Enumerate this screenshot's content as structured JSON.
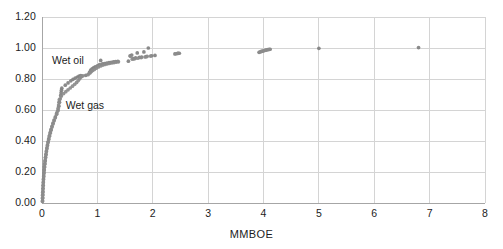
{
  "chart_data": {
    "type": "scatter",
    "title": "",
    "subtitle": "",
    "xlabel": "MMBOE",
    "ylabel": "",
    "xlim": [
      0,
      8
    ],
    "ylim": [
      0,
      1.2
    ],
    "x_ticks": [
      "0",
      "1",
      "2",
      "3",
      "4",
      "5",
      "6",
      "7",
      "8"
    ],
    "y_ticks": [
      "0.00",
      "0.20",
      "0.40",
      "0.60",
      "0.80",
      "1.00",
      "1.20"
    ],
    "grid": true,
    "legend_position": "inline-annotation",
    "marker_color": "#808080",
    "gridline_color": "#d4d4d4",
    "axis_color": "#a6a6a6",
    "annotations": [
      {
        "text": "Wet oil",
        "x": 0.18,
        "y": 0.915
      },
      {
        "text": "Wet gas",
        "x": 0.43,
        "y": 0.625
      }
    ],
    "series": [
      {
        "name": "Wet oil",
        "color": "#808080",
        "points": [
          [
            0.01,
            0.015
          ],
          [
            0.012,
            0.035
          ],
          [
            0.014,
            0.055
          ],
          [
            0.016,
            0.075
          ],
          [
            0.018,
            0.095
          ],
          [
            0.021,
            0.115
          ],
          [
            0.024,
            0.135
          ],
          [
            0.027,
            0.155
          ],
          [
            0.031,
            0.175
          ],
          [
            0.035,
            0.195
          ],
          [
            0.04,
            0.215
          ],
          [
            0.045,
            0.235
          ],
          [
            0.051,
            0.255
          ],
          [
            0.057,
            0.275
          ],
          [
            0.064,
            0.295
          ],
          [
            0.072,
            0.315
          ],
          [
            0.08,
            0.335
          ],
          [
            0.089,
            0.355
          ],
          [
            0.099,
            0.375
          ],
          [
            0.11,
            0.395
          ],
          [
            0.122,
            0.415
          ],
          [
            0.135,
            0.435
          ],
          [
            0.149,
            0.455
          ],
          [
            0.164,
            0.475
          ],
          [
            0.181,
            0.495
          ],
          [
            0.199,
            0.515
          ],
          [
            0.219,
            0.535
          ],
          [
            0.241,
            0.555
          ],
          [
            0.265,
            0.578
          ],
          [
            0.291,
            0.6
          ],
          [
            0.304,
            0.625
          ],
          [
            0.316,
            0.65
          ],
          [
            0.328,
            0.672
          ],
          [
            0.338,
            0.694
          ],
          [
            0.345,
            0.712
          ],
          [
            0.352,
            0.728
          ],
          [
            0.358,
            0.741
          ],
          [
            0.42,
            0.76
          ],
          [
            0.47,
            0.775
          ],
          [
            0.52,
            0.788
          ],
          [
            0.56,
            0.798
          ],
          [
            0.6,
            0.806
          ],
          [
            0.64,
            0.813
          ],
          [
            0.67,
            0.818
          ],
          [
            0.7,
            0.822
          ],
          [
            0.79,
            0.824
          ],
          [
            0.86,
            0.845
          ],
          [
            0.88,
            0.858
          ],
          [
            0.905,
            0.866
          ],
          [
            0.93,
            0.872
          ],
          [
            0.96,
            0.878
          ],
          [
            1.0,
            0.885
          ],
          [
            1.04,
            0.893
          ],
          [
            1.06,
            0.92
          ],
          [
            1.09,
            0.897
          ],
          [
            1.13,
            0.9
          ],
          [
            1.17,
            0.903
          ],
          [
            1.21,
            0.906
          ],
          [
            1.25,
            0.908
          ],
          [
            1.29,
            0.91
          ],
          [
            1.33,
            0.912
          ],
          [
            1.37,
            0.914
          ],
          [
            1.56,
            0.915
          ],
          [
            1.59,
            0.95
          ],
          [
            1.62,
            0.955
          ],
          [
            1.65,
            0.932
          ],
          [
            1.69,
            0.936
          ],
          [
            1.72,
            0.968
          ],
          [
            1.76,
            0.94
          ],
          [
            1.8,
            0.942
          ],
          [
            1.84,
            0.975
          ],
          [
            1.88,
            0.944
          ],
          [
            1.92,
            1.0
          ],
          [
            1.98,
            0.95
          ],
          [
            2.04,
            0.952
          ],
          [
            2.4,
            0.962
          ],
          [
            2.45,
            0.965
          ],
          [
            2.48,
            0.966
          ],
          [
            3.92,
            0.972
          ],
          [
            3.96,
            0.978
          ],
          [
            4.0,
            0.982
          ],
          [
            4.04,
            0.986
          ],
          [
            4.08,
            0.99
          ],
          [
            4.12,
            0.992
          ],
          [
            5.0,
            0.998
          ],
          [
            6.8,
            1.003
          ]
        ]
      },
      {
        "name": "Wet gas",
        "color": "#8c8c8c",
        "points": [
          [
            0.008,
            0.01
          ],
          [
            0.01,
            0.03
          ],
          [
            0.012,
            0.05
          ],
          [
            0.014,
            0.07
          ],
          [
            0.017,
            0.09
          ],
          [
            0.02,
            0.11
          ],
          [
            0.023,
            0.13
          ],
          [
            0.026,
            0.15
          ],
          [
            0.03,
            0.17
          ],
          [
            0.034,
            0.19
          ],
          [
            0.039,
            0.21
          ],
          [
            0.044,
            0.23
          ],
          [
            0.05,
            0.25
          ],
          [
            0.056,
            0.27
          ],
          [
            0.063,
            0.29
          ],
          [
            0.071,
            0.31
          ],
          [
            0.079,
            0.33
          ],
          [
            0.088,
            0.35
          ],
          [
            0.098,
            0.37
          ],
          [
            0.109,
            0.39
          ],
          [
            0.121,
            0.41
          ],
          [
            0.134,
            0.43
          ],
          [
            0.148,
            0.45
          ],
          [
            0.163,
            0.47
          ],
          [
            0.18,
            0.49
          ],
          [
            0.198,
            0.51
          ],
          [
            0.218,
            0.53
          ],
          [
            0.24,
            0.55
          ],
          [
            0.264,
            0.572
          ],
          [
            0.28,
            0.592
          ],
          [
            0.292,
            0.612
          ],
          [
            0.3,
            0.632
          ],
          [
            0.306,
            0.65
          ],
          [
            0.312,
            0.666
          ],
          [
            0.35,
            0.69
          ],
          [
            0.39,
            0.706
          ],
          [
            0.43,
            0.718
          ],
          [
            0.47,
            0.73
          ],
          [
            0.51,
            0.742
          ],
          [
            0.55,
            0.754
          ],
          [
            0.59,
            0.766
          ],
          [
            0.625,
            0.778
          ],
          [
            0.655,
            0.79
          ],
          [
            0.68,
            0.802
          ],
          [
            0.7,
            0.812
          ],
          [
            0.72,
            0.818
          ],
          [
            0.74,
            0.821
          ],
          [
            0.83,
            0.828
          ],
          [
            0.85,
            0.835
          ],
          [
            0.87,
            0.841
          ],
          [
            0.89,
            0.848
          ],
          [
            0.915,
            0.855
          ],
          [
            0.945,
            0.862
          ],
          [
            0.98,
            0.87
          ],
          [
            1.02,
            0.878
          ],
          [
            1.06,
            0.884
          ],
          [
            1.1,
            0.89
          ],
          [
            1.14,
            0.894
          ],
          [
            1.18,
            0.898
          ],
          [
            1.22,
            0.901
          ],
          [
            1.26,
            0.904
          ],
          [
            1.3,
            0.906
          ],
          [
            1.34,
            0.909
          ],
          [
            1.38,
            0.911
          ],
          [
            1.6,
            0.946
          ],
          [
            1.63,
            0.928
          ],
          [
            1.67,
            0.93
          ],
          [
            1.73,
            0.934
          ],
          [
            1.79,
            0.938
          ],
          [
            1.86,
            0.942
          ],
          [
            1.9,
            0.946
          ],
          [
            1.96,
            0.948
          ],
          [
            2.42,
            0.963
          ],
          [
            2.46,
            0.966
          ],
          [
            3.94,
            0.975
          ],
          [
            3.98,
            0.98
          ],
          [
            4.02,
            0.984
          ],
          [
            4.06,
            0.988
          ],
          [
            4.1,
            0.991
          ]
        ]
      }
    ]
  },
  "footer": {
    "caption_fragment": ""
  }
}
